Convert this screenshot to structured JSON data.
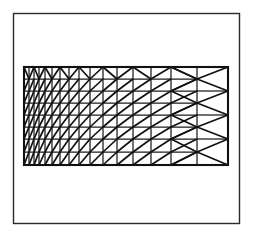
{
  "figure": {
    "title": "Triangular finite element mesh",
    "canvas": {
      "width": 253,
      "height": 236,
      "background": "#ffffff"
    }
  },
  "outer_frame": {
    "name": "outer-frame",
    "x": 13.5,
    "y": 13.5,
    "width": 226,
    "height": 210,
    "stroke": "#2a2a2a",
    "stroke_width": 1.4,
    "fill": "#ffffff"
  },
  "mesh": {
    "name": "mesh-region",
    "x0": 24,
    "y0": 67,
    "x1": 228,
    "y1": 165,
    "boundary_stroke": "#111111",
    "boundary_stroke_width": 2.1,
    "grid_stroke": "#1b1b1b",
    "grid_stroke_width": 1.25,
    "diagonal_stroke": "#111111",
    "diagonal_stroke_width": 1.7,
    "column_x": [
      24,
      29,
      34,
      39,
      45,
      52,
      60,
      69,
      79,
      90,
      103,
      117,
      133,
      151,
      171,
      197,
      228
    ],
    "row_y": [
      67,
      79,
      91,
      103,
      115,
      127,
      139,
      152,
      165
    ],
    "n_columns": 16,
    "n_rows": 8,
    "grading": "geometric refinement toward the left edge",
    "coarse_right_column_x": [
      197,
      228
    ],
    "coarse_right_row_y": [
      67,
      91,
      115,
      139,
      165
    ],
    "top_row_pattern": "alternating up-down diagonals forming zig-zag triangles",
    "right_block_pattern": "bowtie diagonals meeting at mid-edge nodes"
  },
  "legend": {
    "visible": false,
    "entries": []
  },
  "labels": {
    "visible": false,
    "items": []
  },
  "chart_data": {
    "type": "diagram",
    "title": "Triangular finite element mesh",
    "xlabel": "",
    "ylabel": "",
    "grid": true,
    "legend_position": "none",
    "element_type": "triangle",
    "total_columns": 16,
    "total_rows": 8,
    "column_widths": [
      5,
      5,
      5,
      6,
      7,
      8,
      9,
      10,
      11,
      13,
      14,
      16,
      18,
      20,
      26,
      31
    ],
    "row_heights": [
      12,
      12,
      12,
      12,
      12,
      12,
      13,
      13
    ]
  }
}
